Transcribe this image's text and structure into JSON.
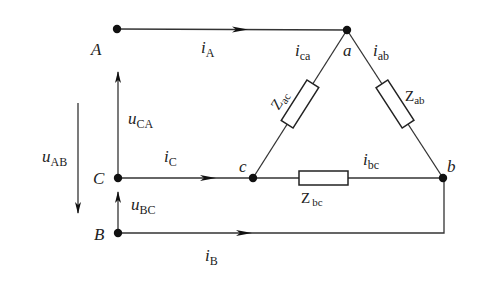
{
  "nodes": {
    "A": {
      "label": "A",
      "x": 117,
      "y": 29
    },
    "B": {
      "label": "B",
      "x": 118,
      "y": 233
    },
    "C": {
      "label": "C",
      "x": 118,
      "y": 178
    },
    "a": {
      "label": "a",
      "x": 347,
      "y": 30
    },
    "b": {
      "label": "b",
      "x": 443,
      "y": 178
    },
    "c": {
      "label": "c",
      "x": 253,
      "y": 178
    }
  },
  "currents": {
    "iA": {
      "main": "i",
      "sub": "A"
    },
    "iB": {
      "main": "i",
      "sub": "B"
    },
    "iC": {
      "main": "i",
      "sub": "C"
    },
    "ica": {
      "main": "i",
      "sub": "ca"
    },
    "iab": {
      "main": "i",
      "sub": "ab"
    },
    "ibc": {
      "main": "i",
      "sub": "bc"
    }
  },
  "voltages": {
    "uAB": {
      "main": "u",
      "sub": "AB"
    },
    "uCA": {
      "main": "u",
      "sub": "CA"
    },
    "uBC": {
      "main": "u",
      "sub": "BC"
    }
  },
  "impedances": {
    "Zac": {
      "main": "Z",
      "sub": "ac"
    },
    "Zab": {
      "main": "Z",
      "sub": "ab"
    },
    "Zbc": {
      "main": "Z",
      "sub": "bc"
    }
  },
  "colors": {
    "line": "#333333",
    "node": "#111111",
    "background": "#ffffff"
  }
}
